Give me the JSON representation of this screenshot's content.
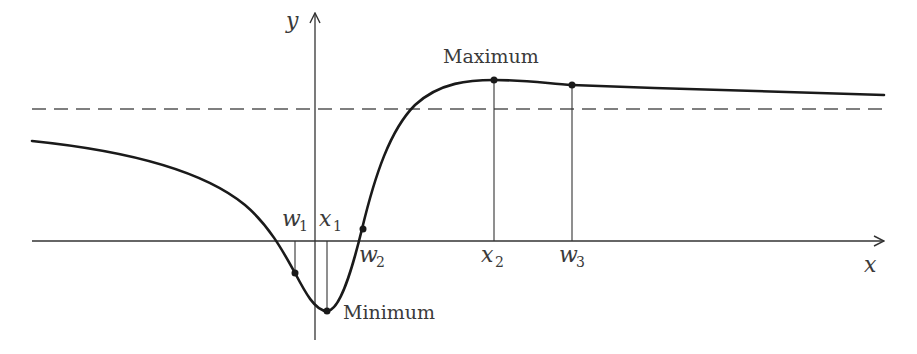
{
  "figure": {
    "axes": {
      "x_label": "x",
      "y_label": "y"
    },
    "labels": {
      "maximum": "Maximum",
      "minimum": "Minimum"
    },
    "points": [
      {
        "id": "w1",
        "base": "w",
        "sub": "1"
      },
      {
        "id": "x1",
        "base": "x",
        "sub": "1"
      },
      {
        "id": "w2",
        "base": "w",
        "sub": "2"
      },
      {
        "id": "x2",
        "base": "x",
        "sub": "2"
      },
      {
        "id": "w3",
        "base": "w",
        "sub": "3"
      }
    ],
    "colors": {
      "curve": "#1a1a1a",
      "axis": "#333333",
      "dashed": "#555555",
      "text": "#3a3a3a"
    }
  }
}
